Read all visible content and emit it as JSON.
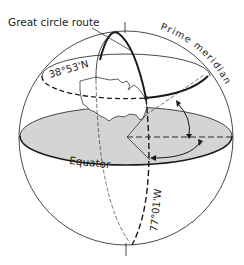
{
  "diagram": {
    "labels": {
      "great_circle_route": "Great circle route",
      "prime_meridian": "Prime meridian",
      "latitude": "38°53'N",
      "longitude": "77°01'W",
      "equator": "Equator"
    },
    "colors": {
      "ink": "#1a1a1a",
      "equator_plane_fill": "#d4d4d4",
      "background": "#ffffff"
    }
  }
}
